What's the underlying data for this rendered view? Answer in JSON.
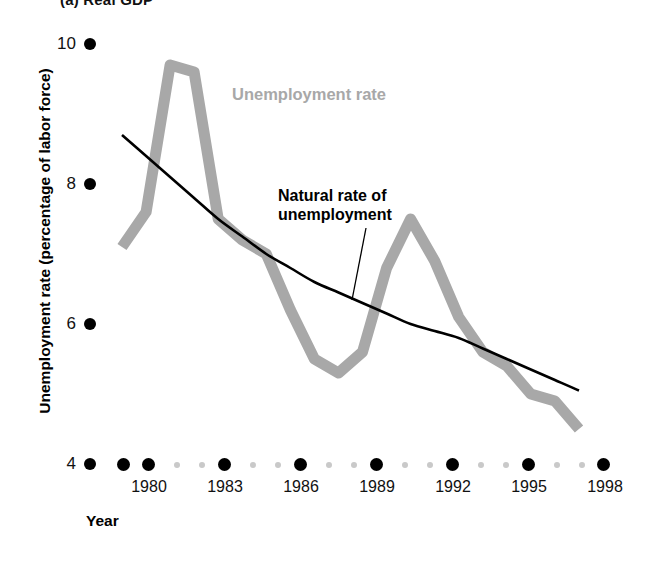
{
  "panel": {
    "title": "(a) Real GDP"
  },
  "axes": {
    "ylabel": "Unemployment rate (percentage of labor force)",
    "xlabel": "Year",
    "yticks": [
      "10",
      "8",
      "6",
      "4"
    ],
    "xticks": [
      "1980",
      "1983",
      "1986",
      "1989",
      "1992",
      "1995",
      "1998"
    ]
  },
  "legend": {
    "unemployment_label": "Unemployment rate",
    "natural_label_line1": "Natural rate of",
    "natural_label_line2": "unemployment"
  },
  "colors": {
    "unemployment_series": "#a8a8a8",
    "natural_series": "#000000",
    "major_dot": "#000000",
    "minor_dot": "#c9c9c9",
    "background": "#ffffff"
  },
  "chart_data": {
    "type": "line",
    "title": "(a) Real GDP",
    "xlabel": "Year",
    "ylabel": "Unemployment rate (percentage of labor force)",
    "xlim": [
      1979,
      1999
    ],
    "ylim": [
      4,
      10
    ],
    "grid": false,
    "legend_position": "inline-annotation",
    "x": [
      1979,
      1980,
      1981,
      1982,
      1983,
      1984,
      1985,
      1986,
      1987,
      1988,
      1989,
      1990,
      1991,
      1992,
      1993,
      1994,
      1995,
      1996,
      1997,
      1998
    ],
    "series": [
      {
        "name": "Unemployment rate",
        "color": "#a8a8a8",
        "values": [
          7.1,
          7.6,
          9.7,
          9.6,
          7.5,
          7.2,
          7.0,
          6.2,
          5.5,
          5.3,
          5.6,
          6.8,
          7.5,
          6.9,
          6.1,
          5.6,
          5.4,
          5.0,
          4.9,
          4.5
        ]
      },
      {
        "name": "Natural rate of unemployment",
        "color": "#000000",
        "values": [
          8.7,
          8.4,
          8.1,
          7.8,
          7.5,
          7.25,
          7.0,
          6.8,
          6.6,
          6.45,
          6.3,
          6.15,
          6.0,
          5.9,
          5.8,
          5.65,
          5.5,
          5.35,
          5.2,
          5.05
        ]
      }
    ],
    "annotations": [
      {
        "text": "Unemployment rate",
        "x": 1986,
        "y": 9.1
      },
      {
        "text": "Natural rate of unemployment",
        "x": 1988,
        "y": 7.7
      }
    ]
  }
}
